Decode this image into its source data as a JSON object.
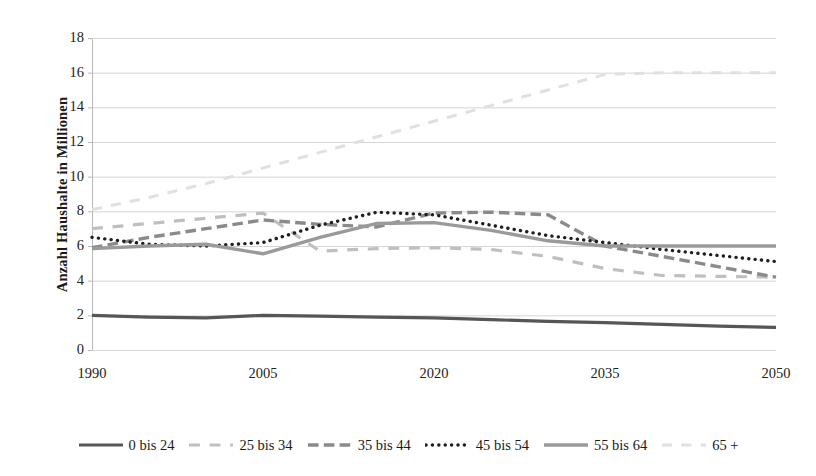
{
  "chart_data": {
    "type": "line",
    "title": "",
    "xlabel": "",
    "ylabel": "Anzahl Haushalte in Millionen",
    "xlim": [
      1990,
      2050
    ],
    "ylim": [
      0,
      18
    ],
    "ytick_step": 2,
    "grid": true,
    "legend_position": "bottom",
    "xticks": [
      "1990",
      "2005",
      "2020",
      "2035",
      "2050"
    ],
    "yticks": [
      "18",
      "16",
      "14",
      "12",
      "10",
      "8",
      "6",
      "4",
      "2",
      "0"
    ],
    "x": [
      1990,
      1995,
      2000,
      2005,
      2010,
      2015,
      2020,
      2025,
      2030,
      2035,
      2040,
      2045,
      2050
    ],
    "series": [
      {
        "name": "0 bis 24",
        "color": "#565656",
        "style": "solid",
        "width": 3.2,
        "values": [
          2.0,
          1.9,
          1.85,
          2.0,
          1.95,
          1.9,
          1.85,
          1.75,
          1.65,
          1.58,
          1.48,
          1.38,
          1.3
        ]
      },
      {
        "name": "25 bis 34",
        "color": "#bfbfbf",
        "style": "dash-dot",
        "width": 3.2,
        "values": [
          7.0,
          7.3,
          7.6,
          7.9,
          5.7,
          5.85,
          5.9,
          5.8,
          5.4,
          4.7,
          4.3,
          4.25,
          4.2
        ]
      },
      {
        "name": "35 bis 44",
        "color": "#8a8a8a",
        "style": "long-dash",
        "width": 3.4,
        "values": [
          5.9,
          6.5,
          7.0,
          7.5,
          7.25,
          7.1,
          7.9,
          7.95,
          7.8,
          6.0,
          5.4,
          4.8,
          4.2
        ]
      },
      {
        "name": "45 bis 54",
        "color": "#1f1f1f",
        "style": "dotted",
        "width": 3.4,
        "values": [
          6.5,
          6.1,
          6.0,
          6.2,
          7.2,
          7.95,
          7.8,
          7.2,
          6.6,
          6.2,
          5.8,
          5.45,
          5.1
        ]
      },
      {
        "name": "55 bis 64",
        "color": "#9a9a9a",
        "style": "solid",
        "width": 3.4,
        "values": [
          5.85,
          6.0,
          6.1,
          5.55,
          6.5,
          7.3,
          7.35,
          6.9,
          6.3,
          6.0,
          6.0,
          6.0,
          6.0
        ]
      },
      {
        "name": "65 +",
        "color": "#e0e0e0",
        "style": "dash-dot",
        "width": 3.0,
        "values": [
          8.1,
          8.8,
          9.6,
          10.5,
          11.4,
          12.3,
          13.2,
          14.1,
          15.0,
          15.9,
          16.0,
          16.0,
          16.0
        ]
      }
    ]
  },
  "legend": {
    "items": [
      {
        "label": "0 bis 24"
      },
      {
        "label": "25 bis 34"
      },
      {
        "label": "35 bis 44"
      },
      {
        "label": "45 bis 54"
      },
      {
        "label": "55 bis 64"
      },
      {
        "label": "65 +"
      }
    ]
  },
  "style": {
    "plot_bg": "#ffffff",
    "grid_color": "#d5d5d5",
    "axis_color": "#b8b8b8",
    "text_color": "#1a1a1a"
  }
}
